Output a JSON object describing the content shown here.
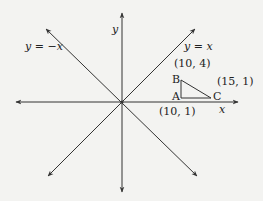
{
  "diagram": {
    "axes": {
      "x_label": "x",
      "y_label": "y"
    },
    "lines": [
      {
        "label": "y = x",
        "equation": "y=x"
      },
      {
        "label": "y = −x",
        "equation": "y=-x"
      }
    ],
    "triangle": {
      "vertices": [
        {
          "name": "A",
          "coords": "(10, 1)"
        },
        {
          "name": "B",
          "coords": "(10, 4)"
        },
        {
          "name": "C",
          "coords": "(15, 1)"
        }
      ]
    },
    "colors": {
      "line": "#333333",
      "background": "#f3f3f1"
    }
  }
}
